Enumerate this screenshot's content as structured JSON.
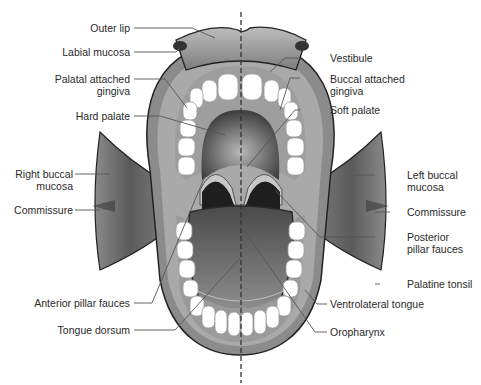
{
  "diagram": {
    "midline": "dashed vertical midline",
    "labels_left": [
      {
        "id": "outer-lip",
        "text": "Outer lip"
      },
      {
        "id": "labial-mucosa",
        "text": "Labial mucosa"
      },
      {
        "id": "palatal-attached-gingiva",
        "line1": "Palatal attached",
        "line2": "gingiva"
      },
      {
        "id": "hard-palate",
        "text": "Hard palate"
      },
      {
        "id": "right-buccal-mucosa",
        "line1": "Right buccal",
        "line2": "mucosa"
      },
      {
        "id": "commissure-right",
        "text": "Commissure"
      },
      {
        "id": "anterior-pillar-fauces",
        "text": "Anterior pillar fauces"
      },
      {
        "id": "tongue-dorsum",
        "text": "Tongue dorsum"
      }
    ],
    "labels_right": [
      {
        "id": "vestibule",
        "text": "Vestibule"
      },
      {
        "id": "buccal-attached-gingiva",
        "line1": "Buccal attached",
        "line2": "gingiva"
      },
      {
        "id": "soft-palate",
        "text": "Soft palate"
      },
      {
        "id": "left-buccal-mucosa",
        "line1": "Left buccal",
        "line2": "mucosa"
      },
      {
        "id": "commissure-left",
        "text": "Commissure"
      },
      {
        "id": "posterior-pillar-fauces",
        "line1": "Posterior",
        "line2": "pillar fauces"
      },
      {
        "id": "palatine-tonsil",
        "text": "Palatine tonsil"
      },
      {
        "id": "ventrolateral-tongue",
        "text": "Ventrolateral tongue"
      },
      {
        "id": "oropharynx",
        "text": "Oropharynx"
      }
    ],
    "colors": {
      "line": "#555555",
      "text": "#2a2a2a",
      "gum": "#9a9a9a",
      "cheek_dark": "#5e5e5e",
      "tongue": "#6f6f6f",
      "throat": "#1e1e1e",
      "teeth": "#ffffff"
    }
  }
}
